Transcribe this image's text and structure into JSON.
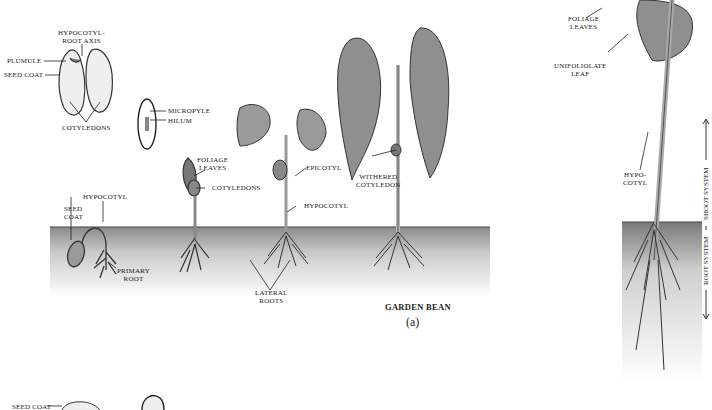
{
  "figure": {
    "title": "GARDEN BEAN",
    "panel_label": "(a)"
  },
  "seed_labels": {
    "hypocotyl_root_axis_1": "HYPOCOTYL-",
    "hypocotyl_root_axis_2": "ROOT AXIS",
    "plumule": "PLUMULE",
    "seed_coat": "SEED COAT",
    "cotyledons": "COTYLEDONS",
    "micropyle": "MICROPYLE",
    "hilum": "HILUM"
  },
  "seedling_labels": {
    "hypocotyl": "HYPOCOTYL",
    "seed_coat_1": "SEED",
    "seed_coat_2": "COAT",
    "primary_root_1": "PRIMARY",
    "primary_root_2": "ROOT",
    "foliage_leaves_1": "FOLIAGE",
    "foliage_leaves_2": "LEAVES",
    "cotyledons": "COTYLEDONS",
    "epicotyl": "EPICOTYL",
    "hypocotyl_2": "HYPOCOTYL",
    "lateral_roots_1": "LATERAL",
    "lateral_roots_2": "ROOTS",
    "withered_cotyledon_1": "WITHERED",
    "withered_cotyledon_2": "COTYLEDON"
  },
  "mature_plant_labels": {
    "foliage_leaves_1": "FOLIAGE",
    "foliage_leaves_2": "LEAVES",
    "unifoliolate_1": "UNIFOLIOLATE",
    "unifoliolate_2": "LEAF",
    "hypocotyl_1": "HYPO-",
    "hypocotyl_2": "COTYL",
    "shoot_system": "SHOOT SYSTEM",
    "root_system": "ROOT SYSTEM"
  },
  "bottom_partial_labels": {
    "seed_coat": "SEED COAT"
  },
  "colors": {
    "ink": "#222222",
    "soil_dark": "#8a8a8a",
    "soil_light": "#f2f2f2",
    "leaf": "#9a9a9a"
  }
}
